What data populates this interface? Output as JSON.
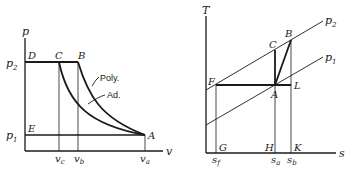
{
  "left_diagram": {
    "title": "p-v diagram",
    "axes": {
      "y_label": "p",
      "x_label": "v"
    },
    "pressure_labels": {
      "p2": "p",
      "p2_sub": "2",
      "p1": "p",
      "p1_sub": "1"
    },
    "points": {
      "D": "D",
      "C": "C",
      "B": "B",
      "E": "E",
      "A": "A"
    },
    "volume_labels": {
      "vc": "v",
      "vc_sub": "c",
      "vb": "v",
      "vb_sub": "b",
      "va": "v",
      "va_sub": "a"
    },
    "curve_labels": {
      "poly": "Poly.",
      "ad": "Ad."
    }
  },
  "right_diagram": {
    "title": "T-s diagram",
    "axes": {
      "y_label": "T",
      "x_label": "s"
    },
    "isobar_labels": {
      "p2": "p",
      "p2_sub": "2",
      "p1": "p",
      "p1_sub": "1"
    },
    "points": {
      "C": "C",
      "B": "B",
      "F": "F",
      "A": "A",
      "L": "L",
      "G": "G",
      "H": "H",
      "K": "K"
    },
    "entropy_labels": {
      "sf": "s",
      "sf_sub": "f",
      "sa": "s",
      "sa_sub": "a",
      "sb": "s",
      "sb_sub": "b"
    }
  }
}
